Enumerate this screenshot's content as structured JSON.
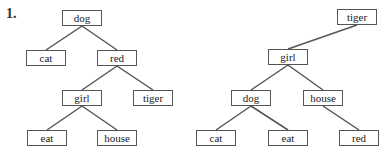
{
  "problem_label": "1.",
  "colors": {
    "edge": "#555555",
    "border": "#555555",
    "text": "#222222"
  },
  "trees": [
    {
      "name": "left-tree",
      "nodes": [
        {
          "id": "dog",
          "label": "dog",
          "x": 62,
          "y": 10
        },
        {
          "id": "cat",
          "label": "cat",
          "x": 26,
          "y": 50
        },
        {
          "id": "red",
          "label": "red",
          "x": 97,
          "y": 50
        },
        {
          "id": "girl",
          "label": "girl",
          "x": 62,
          "y": 90
        },
        {
          "id": "tiger",
          "label": "tiger",
          "x": 133,
          "y": 90
        },
        {
          "id": "eat",
          "label": "eat",
          "x": 27,
          "y": 130
        },
        {
          "id": "house",
          "label": "house",
          "x": 97,
          "y": 130
        }
      ],
      "edges": [
        [
          "dog",
          "cat"
        ],
        [
          "dog",
          "red"
        ],
        [
          "red",
          "girl"
        ],
        [
          "red",
          "tiger"
        ],
        [
          "girl",
          "eat"
        ],
        [
          "girl",
          "house"
        ]
      ]
    },
    {
      "name": "right-tree",
      "nodes": [
        {
          "id": "tiger",
          "label": "tiger",
          "x": 337,
          "y": 9
        },
        {
          "id": "girl",
          "label": "girl",
          "x": 268,
          "y": 49
        },
        {
          "id": "dog",
          "label": "dog",
          "x": 231,
          "y": 90
        },
        {
          "id": "house",
          "label": "house",
          "x": 303,
          "y": 90
        },
        {
          "id": "cat",
          "label": "cat",
          "x": 196,
          "y": 130
        },
        {
          "id": "eat",
          "label": "eat",
          "x": 268,
          "y": 130
        },
        {
          "id": "red",
          "label": "red",
          "x": 339,
          "y": 130
        }
      ],
      "edges": [
        [
          "tiger",
          "girl"
        ],
        [
          "girl",
          "dog"
        ],
        [
          "girl",
          "house"
        ],
        [
          "dog",
          "cat"
        ],
        [
          "dog",
          "eat"
        ],
        [
          "house",
          "red"
        ]
      ]
    }
  ]
}
